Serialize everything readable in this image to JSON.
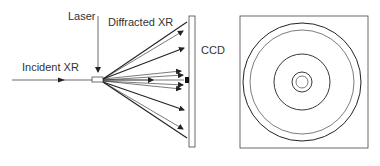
{
  "labels": {
    "laser": "Laser",
    "diffracted": "Diffracted XR",
    "incident": "Incident XR",
    "ccd": "CCD"
  },
  "colors": {
    "line": "#222222",
    "thin": "#444444",
    "background": "#ffffff"
  },
  "detector_pattern": {
    "rings": 5,
    "description": "concentric diffraction rings on square detector"
  }
}
